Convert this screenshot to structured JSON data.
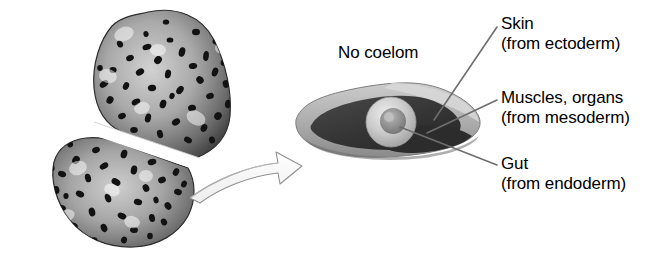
{
  "figure": {
    "background_color": "#ffffff",
    "organism_label": "flatworm-specimen"
  },
  "labels": {
    "no_coelom": "No coelom",
    "skin": {
      "name": "Skin",
      "source": "(from ectoderm)"
    },
    "muscles": {
      "name": "Muscles, organs",
      "source": "(from mesoderm)"
    },
    "gut": {
      "name": "Gut",
      "source": "(from endoderm)"
    }
  },
  "colors": {
    "text": "#000000",
    "background": "#ffffff",
    "leader_line": "#6b6b6b",
    "skin_layer": "#b9b9b9",
    "skin_layer_dark": "#8e8e8e",
    "mesoderm": "#3a3a3a",
    "mesoderm_shadow": "#2a2a2a",
    "gut_outer": "#cfcfcf",
    "gut_inner": "#8a8a8a",
    "worm_body_light": "#b5b5b5",
    "worm_body_dark": "#4a4a4a",
    "worm_speckle": "#141414",
    "arrow_fill": "#fbfbfb",
    "arrow_stroke": "#8f8f8f"
  },
  "elements": {
    "worm": "flatworm-body",
    "worm_split": "cut-plane-band",
    "arrow": "curved-pointer-arrow",
    "cross_section": "body-cross-section",
    "gut_sphere": "gut-structure",
    "skin_leader": "skin-leader-line",
    "muscles_leader": "muscles-leader-line",
    "gut_leader": "gut-leader-line"
  }
}
